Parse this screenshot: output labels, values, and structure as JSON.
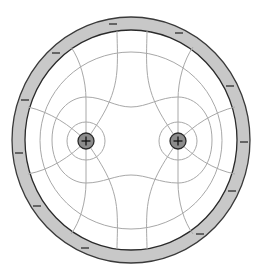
{
  "diagram": {
    "colors": {
      "background": "#ffffff",
      "ring_fill": "#c8c8c8",
      "ring_stroke": "#3a3a3a",
      "line_color": "#a8a8a8",
      "charge_fill": "#8c8c8c",
      "charge_stroke": "#2a2a2a"
    },
    "ring": {
      "center": [
        131,
        140
      ],
      "outer_radius_x": 119,
      "outer_radius_y": 123,
      "inner_radius_x": 106,
      "inner_radius_y": 110,
      "charge_sign": "−",
      "minus_marks": [
        {
          "x": 113,
          "y": 24,
          "angle": 0
        },
        {
          "x": 179,
          "y": 33,
          "angle": 20
        },
        {
          "x": 56,
          "y": 53,
          "angle": -30
        },
        {
          "x": 230,
          "y": 86,
          "angle": 55
        },
        {
          "x": 25,
          "y": 100,
          "angle": -65
        },
        {
          "x": 244,
          "y": 142,
          "angle": 90
        },
        {
          "x": 19,
          "y": 153,
          "angle": 90
        },
        {
          "x": 232,
          "y": 191,
          "angle": -65
        },
        {
          "x": 37,
          "y": 206,
          "angle": 55
        },
        {
          "x": 200,
          "y": 234,
          "angle": -30
        },
        {
          "x": 85,
          "y": 248,
          "angle": 20
        }
      ]
    },
    "charges": [
      {
        "label": "+",
        "x": 86,
        "y": 141,
        "r": 8
      },
      {
        "label": "+",
        "x": 178,
        "y": 141,
        "r": 8
      }
    ]
  }
}
